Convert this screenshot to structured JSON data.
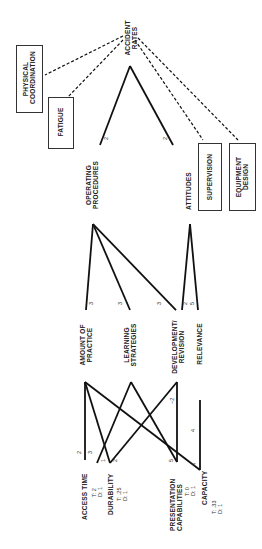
{
  "diagram": {
    "orientation": "rotated-90-ccw",
    "top_node": {
      "label_1": "ACCIDENT",
      "label_2": "RATES"
    },
    "external_factors": [
      {
        "label_1": "PHYSICAL",
        "label_2": "COORDINATION"
      },
      {
        "label_1": "FATIGUE"
      },
      {
        "label_1": "SUPERVISION"
      },
      {
        "label_1": "EQUIPMENT",
        "label_2": "DESIGN"
      }
    ],
    "level2": [
      {
        "label_1": "OPERATING",
        "label_2": "PROCEDURES",
        "weight_to_top": "2"
      },
      {
        "label_1": "ATTITUDES",
        "weight_to_top": "2"
      }
    ],
    "level3": [
      {
        "label_1": "AMOUNT OF",
        "label_2": "PRACTICE"
      },
      {
        "label_1": "LEARNING",
        "label_2": "STRATEGIES"
      },
      {
        "label_1": "DEVELOPMENT/",
        "label_2": "REVISION"
      },
      {
        "label_1": "RELEVANCE"
      }
    ],
    "level3_weights": {
      "op_to_amount": "3",
      "op_to_learning": "3",
      "op_to_development": "3",
      "att_to_development": "2",
      "att_to_relevance": "5"
    },
    "level4": [
      {
        "label": "ACCESS TIME",
        "t": "T:  2",
        "d": "D:  1"
      },
      {
        "label": "DURABILITY",
        "t": "T:  .25",
        "d": "D:  1"
      },
      {
        "label_1": "PRESENTATION",
        "label_2": "CAPABILITIES",
        "t": "T:  0",
        "d": "D:  1"
      },
      {
        "label": "CAPACITY",
        "t": "T:  .33",
        "d": "D:  1"
      }
    ],
    "level4_weights": {
      "access_a": "2",
      "access_b": "3",
      "durability_a": "1",
      "durability_b": "2",
      "presentation": "5",
      "development_presentation": "−2",
      "relevance_capacity": "4",
      "capacity": "4"
    }
  }
}
